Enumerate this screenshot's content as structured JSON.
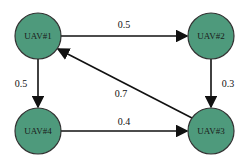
{
  "nodes": [
    {
      "id": "UAV#1",
      "label": "UAV#1",
      "x": 38,
      "y": 36
    },
    {
      "id": "UAV#2",
      "label": "UAV#2",
      "x": 211,
      "y": 36
    },
    {
      "id": "UAV#3",
      "label": "UAV#3",
      "x": 211,
      "y": 131
    },
    {
      "id": "UAV#4",
      "label": "UAV#4",
      "x": 38,
      "y": 131
    }
  ],
  "edges": [
    {
      "from": "UAV#1",
      "to": "UAV#2",
      "weight": "0.5"
    },
    {
      "from": "UAV#2",
      "to": "UAV#3",
      "weight": "0.3"
    },
    {
      "from": "UAV#3",
      "to": "UAV#1",
      "weight": "0.7"
    },
    {
      "from": "UAV#1",
      "to": "UAV#4",
      "weight": "0.5"
    },
    {
      "from": "UAV#4",
      "to": "UAV#3",
      "weight": "0.4"
    }
  ],
  "colors": {
    "node_fill": "#4e9a7c"
  }
}
